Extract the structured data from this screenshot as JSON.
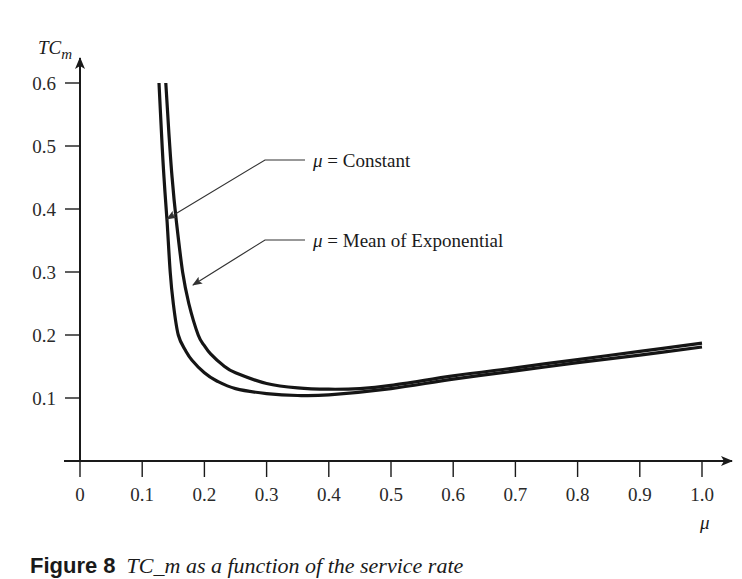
{
  "chart_data": {
    "type": "line",
    "title": "",
    "xlabel": "μ",
    "ylabel": "TC_m",
    "ylabel_main": "TC",
    "ylabel_sub": "m",
    "xlim": [
      0,
      1.0
    ],
    "ylim": [
      0,
      0.6
    ],
    "grid": false,
    "legend_position": "inline annotations with leader arrows",
    "x_ticks": [
      "0",
      "0.1",
      "0.2",
      "0.3",
      "0.4",
      "0.5",
      "0.6",
      "0.7",
      "0.8",
      "0.9",
      "1.0"
    ],
    "y_ticks": [
      "0.1",
      "0.2",
      "0.3",
      "0.4",
      "0.5",
      "0.6"
    ],
    "series": [
      {
        "name": "μ = Constant",
        "x": [
          0.127,
          0.131,
          0.135,
          0.14,
          0.145,
          0.15,
          0.158,
          0.17,
          0.18,
          0.2,
          0.22,
          0.25,
          0.3,
          0.35,
          0.4,
          0.5,
          0.6,
          0.7,
          0.8,
          0.9,
          1.0
        ],
        "values": [
          0.6,
          0.52,
          0.45,
          0.38,
          0.3,
          0.25,
          0.2,
          0.175,
          0.16,
          0.14,
          0.127,
          0.115,
          0.107,
          0.104,
          0.105,
          0.115,
          0.13,
          0.143,
          0.156,
          0.168,
          0.181
        ]
      },
      {
        "name": "μ = Mean of Exponential",
        "x": [
          0.138,
          0.143,
          0.148,
          0.155,
          0.165,
          0.175,
          0.19,
          0.2,
          0.21,
          0.23,
          0.25,
          0.3,
          0.35,
          0.4,
          0.45,
          0.5,
          0.6,
          0.7,
          0.8,
          0.9,
          1.0
        ],
        "values": [
          0.6,
          0.52,
          0.45,
          0.38,
          0.3,
          0.25,
          0.2,
          0.183,
          0.17,
          0.152,
          0.14,
          0.123,
          0.116,
          0.114,
          0.115,
          0.12,
          0.135,
          0.148,
          0.161,
          0.174,
          0.187
        ]
      }
    ],
    "annotations": [
      {
        "text": "Constant",
        "prefix": "μ = ",
        "points_to_series": 0
      },
      {
        "text": "Mean of Exponential",
        "prefix": "μ = ",
        "points_to_series": 1
      }
    ]
  },
  "caption": {
    "label": "Figure 8",
    "text": "TC_m as a function of the service rate",
    "partially_visible": true
  }
}
